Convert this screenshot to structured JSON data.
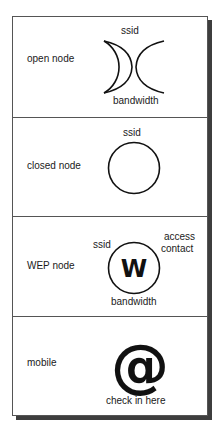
{
  "legend": {
    "rows": [
      {
        "label": "open node",
        "icon": "open-node-arcs-icon",
        "captions": {
          "top": "ssid",
          "bottom": "bandwidth"
        }
      },
      {
        "label": "closed node",
        "icon": "closed-node-circle-icon",
        "captions": {
          "top": "ssid"
        }
      },
      {
        "label": "WEP node",
        "icon": "wep-node-circle-icon",
        "glyph": "W",
        "captions": {
          "top_left": "ssid",
          "top_right_1": "access",
          "top_right_2": "contact",
          "bottom": "bandwidth"
        }
      },
      {
        "label": "mobile",
        "icon": "at-sign-icon",
        "glyph": "@",
        "captions": {
          "bottom": "check in here"
        }
      }
    ],
    "colors": {
      "stroke": "#111111",
      "border": "#555555",
      "shadow": "#3e3e3e",
      "background": "#ffffff"
    }
  }
}
